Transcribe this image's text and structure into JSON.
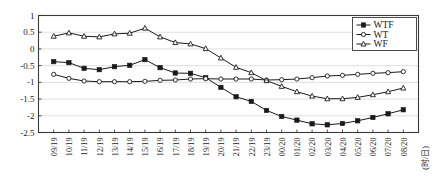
{
  "chart_data": {
    "type": "line",
    "title": "",
    "xlabel": "(时/日)",
    "ylabel": "",
    "ylim": [
      -2.5,
      1
    ],
    "yticks": [
      1,
      0.5,
      0,
      -0.5,
      -1,
      -1.5,
      -2,
      -2.5
    ],
    "ytick_labels": [
      "1",
      "0.5",
      "0",
      "-0.5",
      "-1",
      "-1.5",
      "-2",
      "-2.5"
    ],
    "grid": true,
    "legend_position": "top-right",
    "categories": [
      "09/19",
      "10/19",
      "11/19",
      "12/19",
      "13/19",
      "14/19",
      "15/19",
      "16/19",
      "17/19",
      "18/19",
      "19/19",
      "20/19",
      "21/19",
      "22/19",
      "23/19",
      "00/20",
      "01/20",
      "02/20",
      "03/20",
      "04/20",
      "05/20",
      "06/20",
      "07/20",
      "08/20"
    ],
    "series": [
      {
        "name": "WTF",
        "marker": "filled-square",
        "values": [
          -0.38,
          -0.41,
          -0.58,
          -0.62,
          -0.53,
          -0.49,
          -0.32,
          -0.56,
          -0.72,
          -0.73,
          -0.86,
          -1.15,
          -1.43,
          -1.57,
          -1.84,
          -2.02,
          -2.13,
          -2.24,
          -2.27,
          -2.23,
          -2.15,
          -2.05,
          -1.94,
          -1.82
        ]
      },
      {
        "name": "WT",
        "marker": "open-circle",
        "values": [
          -0.76,
          -0.88,
          -0.96,
          -0.98,
          -0.98,
          -0.98,
          -0.97,
          -0.94,
          -0.93,
          -0.9,
          -0.89,
          -0.9,
          -0.9,
          -0.9,
          -0.93,
          -0.92,
          -0.9,
          -0.86,
          -0.81,
          -0.79,
          -0.76,
          -0.73,
          -0.71,
          -0.68
        ]
      },
      {
        "name": "WF",
        "marker": "open-triangle",
        "values": [
          0.38,
          0.48,
          0.38,
          0.36,
          0.45,
          0.47,
          0.62,
          0.36,
          0.19,
          0.15,
          0.01,
          -0.27,
          -0.55,
          -0.71,
          -0.95,
          -1.12,
          -1.28,
          -1.41,
          -1.49,
          -1.49,
          -1.45,
          -1.37,
          -1.28,
          -1.17
        ]
      }
    ]
  },
  "legend": {
    "entries": [
      {
        "label": "WTF"
      },
      {
        "label": "WT"
      },
      {
        "label": "WF"
      }
    ]
  },
  "axis": {
    "x_title": "(时/日)"
  }
}
